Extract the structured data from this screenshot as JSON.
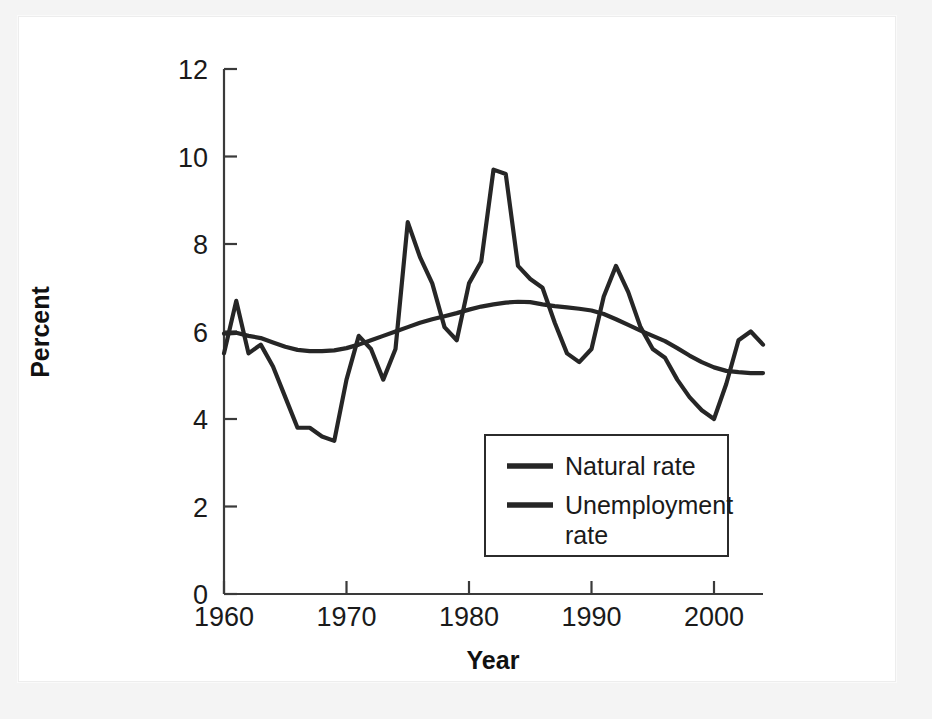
{
  "chart_data": {
    "type": "line",
    "title": "",
    "xlabel": "Year",
    "ylabel": "Percent",
    "xlim": [
      1960,
      2004
    ],
    "ylim": [
      0,
      12
    ],
    "grid": false,
    "legend_position": "inside-bottom-center",
    "x_ticks": [
      "1960",
      "1970",
      "1980",
      "1990",
      "2000"
    ],
    "x_tick_values": [
      1960,
      1970,
      1980,
      1990,
      2000
    ],
    "y_ticks": [
      "0",
      "2",
      "4",
      "6",
      "8",
      "10",
      "12"
    ],
    "y_tick_values": [
      0,
      2,
      4,
      6,
      8,
      10,
      12
    ],
    "x": [
      1960,
      1961,
      1962,
      1963,
      1964,
      1965,
      1966,
      1967,
      1968,
      1969,
      1970,
      1971,
      1972,
      1973,
      1974,
      1975,
      1976,
      1977,
      1978,
      1979,
      1980,
      1981,
      1982,
      1983,
      1984,
      1985,
      1986,
      1987,
      1988,
      1989,
      1990,
      1991,
      1992,
      1993,
      1994,
      1995,
      1996,
      1997,
      1998,
      1999,
      2000,
      2001,
      2002,
      2003,
      2004
    ],
    "series": [
      {
        "name": "Natural rate",
        "color": "#262626",
        "values": [
          5.95,
          5.97,
          5.9,
          5.85,
          5.75,
          5.65,
          5.58,
          5.55,
          5.55,
          5.57,
          5.62,
          5.7,
          5.8,
          5.9,
          6.0,
          6.1,
          6.2,
          6.28,
          6.35,
          6.42,
          6.5,
          6.57,
          6.62,
          6.66,
          6.68,
          6.67,
          6.62,
          6.58,
          6.55,
          6.52,
          6.48,
          6.4,
          6.28,
          6.15,
          6.02,
          5.9,
          5.78,
          5.62,
          5.45,
          5.3,
          5.18,
          5.1,
          5.07,
          5.05,
          5.05
        ]
      },
      {
        "name": "Unemployment rate",
        "color": "#262626",
        "values": [
          5.5,
          6.7,
          5.5,
          5.7,
          5.2,
          4.5,
          3.8,
          3.8,
          3.6,
          3.5,
          4.9,
          5.9,
          5.6,
          4.9,
          5.6,
          8.5,
          7.7,
          7.1,
          6.1,
          5.8,
          7.1,
          7.6,
          9.7,
          9.6,
          7.5,
          7.2,
          7.0,
          6.2,
          5.5,
          5.3,
          5.6,
          6.8,
          7.5,
          6.9,
          6.1,
          5.6,
          5.4,
          4.9,
          4.5,
          4.2,
          4.0,
          4.8,
          5.8,
          6.0,
          5.7
        ]
      }
    ]
  },
  "legend": {
    "entries": [
      {
        "label": "Natural rate"
      },
      {
        "label": "Unemployment",
        "label2": "rate"
      }
    ]
  }
}
